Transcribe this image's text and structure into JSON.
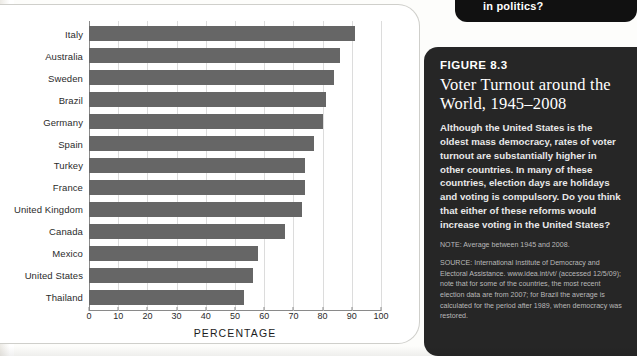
{
  "chart_data": {
    "type": "bar",
    "orientation": "horizontal",
    "xlabel": "PERCENTAGE",
    "ylabel": "",
    "xlim": [
      0,
      100
    ],
    "xticks": [
      0,
      10,
      20,
      30,
      40,
      50,
      60,
      70,
      80,
      90,
      100
    ],
    "grid": true,
    "legend": "none",
    "bar_color": "#666666",
    "categories": [
      "Italy",
      "Australia",
      "Sweden",
      "Brazil",
      "Germany",
      "Spain",
      "Turkey",
      "France",
      "United Kingdom",
      "Canada",
      "Mexico",
      "United States",
      "Thailand"
    ],
    "values": [
      91,
      86,
      84,
      81,
      80,
      77,
      74,
      74,
      73,
      67,
      58,
      56,
      53
    ]
  },
  "chart": {
    "axis_title": "PERCENTAGE",
    "tick_labels": [
      "0",
      "10",
      "20",
      "30",
      "40",
      "50",
      "60",
      "70",
      "80",
      "90",
      "100"
    ],
    "category_labels": [
      "Italy",
      "Australia",
      "Sweden",
      "Brazil",
      "Germany",
      "Spain",
      "Turkey",
      "France",
      "United Kingdom",
      "Canada",
      "Mexico",
      "United States",
      "Thailand"
    ]
  },
  "top_callout": {
    "text": "in politics?"
  },
  "figure_panel": {
    "figure_number": "FIGURE 8.3",
    "title": "Voter Turnout around the World, 1945–2008",
    "body": "Although the United States is the oldest mass democracy, rates of voter turnout are substantially higher in other countries. In many of these countries, election days are holidays and voting is compulsory. Do you think that either of these reforms would increase voting in the United States?",
    "note": "NOTE: Average between 1945 and 2008.",
    "source": "SOURCE: International Institute of Democracy and Electoral Assistance. www.idea.int/vt/ (accessed 12/5/09); note that for some of the countries, the most recent election data are from 2007; for Brazil the average is calculated for the period after 1989, when democracy was restored."
  },
  "colors": {
    "panel_background": "#262626",
    "bar": "#666666",
    "callout_background": "#111111",
    "page_background": "#fdfdfb"
  }
}
